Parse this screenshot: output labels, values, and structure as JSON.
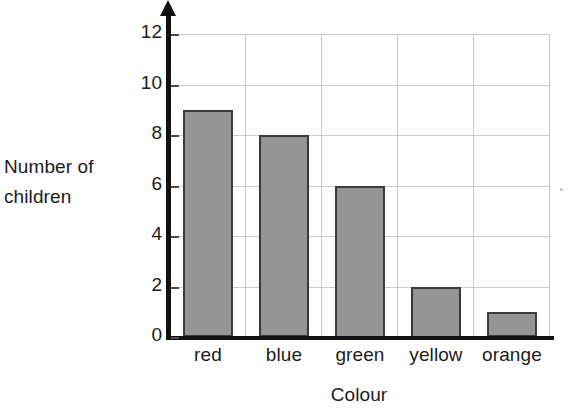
{
  "chart_data": {
    "type": "bar",
    "title": "",
    "categories": [
      "red",
      "blue",
      "green",
      "yellow",
      "orange"
    ],
    "values": [
      9,
      8,
      6,
      2,
      1
    ],
    "series": [
      {
        "name": "Number of children",
        "values": [
          9,
          8,
          6,
          2,
          1
        ]
      }
    ],
    "xlabel": "Colour",
    "ylabel_lines": [
      "Number of",
      "children"
    ],
    "ylabel": "Number of children",
    "ylim": [
      0,
      12
    ],
    "ytick_values": [
      0,
      2,
      4,
      6,
      8,
      10,
      12
    ],
    "ytick_labels": [
      "0",
      "2",
      "4",
      "6",
      "8",
      "10",
      "12"
    ],
    "ytick_step": 2,
    "grid": "both",
    "legend": "none",
    "bar_fill_color": "#959595",
    "bar_border_color": "#3b3b3b",
    "gridline_color": "#c9c9c9",
    "axis_color": "#111111",
    "background_color": "#ffffff"
  },
  "axes": {
    "y": {
      "title_line1": "Number of",
      "title_line2": "children",
      "ticks": [
        "0",
        "2",
        "4",
        "6",
        "8",
        "10",
        "12"
      ]
    },
    "x": {
      "title": "Colour",
      "categories": [
        "red",
        "blue",
        "green",
        "yellow",
        "orange"
      ]
    }
  }
}
